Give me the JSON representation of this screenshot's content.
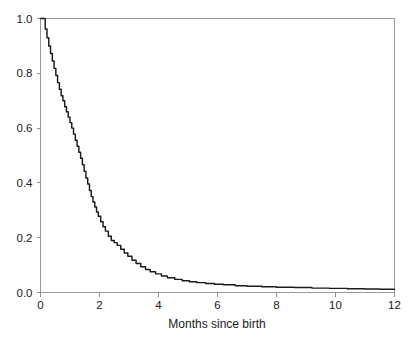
{
  "chart_data": {
    "type": "line",
    "title": "",
    "subtitle": "",
    "xlabel": "Months since birth",
    "ylabel": "",
    "xlim": [
      0,
      12
    ],
    "ylim": [
      0,
      1.0
    ],
    "grid": false,
    "legend": null,
    "x_ticks": [
      0,
      2,
      4,
      6,
      8,
      10,
      12
    ],
    "x_tick_labels": [
      "0",
      "2",
      "4",
      "6",
      "8",
      "10",
      "12"
    ],
    "y_ticks": [
      0.0,
      0.2,
      0.4,
      0.6,
      0.8,
      1.0
    ],
    "y_tick_labels": [
      "0.0",
      "0.2",
      "0.4",
      "0.6",
      "0.8",
      "1.0"
    ],
    "series": [
      {
        "name": "survival",
        "color": "#1a1a1a",
        "style": "step-decreasing",
        "x": [
          0.0,
          0.1,
          0.16,
          0.22,
          0.28,
          0.34,
          0.4,
          0.46,
          0.52,
          0.58,
          0.64,
          0.7,
          0.76,
          0.82,
          0.88,
          0.94,
          1.0,
          1.06,
          1.12,
          1.18,
          1.24,
          1.3,
          1.36,
          1.42,
          1.48,
          1.54,
          1.6,
          1.66,
          1.72,
          1.78,
          1.84,
          1.9,
          1.96,
          2.04,
          2.12,
          2.2,
          2.3,
          2.4,
          2.5,
          2.6,
          2.72,
          2.84,
          2.96,
          3.1,
          3.24,
          3.4,
          3.56,
          3.72,
          3.9,
          4.1,
          4.3,
          4.55,
          4.8,
          5.05,
          5.3,
          5.6,
          5.9,
          6.2,
          6.6,
          7.0,
          7.5,
          8.0,
          8.6,
          9.2,
          9.8,
          10.4,
          11.0,
          11.5,
          12.0
        ],
        "y": [
          1.0,
          1.0,
          0.962,
          0.93,
          0.9,
          0.872,
          0.845,
          0.818,
          0.792,
          0.766,
          0.742,
          0.718,
          0.7,
          0.678,
          0.66,
          0.64,
          0.62,
          0.6,
          0.578,
          0.556,
          0.534,
          0.512,
          0.49,
          0.466,
          0.442,
          0.418,
          0.396,
          0.372,
          0.35,
          0.33,
          0.312,
          0.294,
          0.278,
          0.258,
          0.24,
          0.224,
          0.205,
          0.19,
          0.182,
          0.172,
          0.158,
          0.144,
          0.132,
          0.118,
          0.106,
          0.094,
          0.084,
          0.076,
          0.068,
          0.06,
          0.054,
          0.048,
          0.043,
          0.039,
          0.036,
          0.033,
          0.03,
          0.028,
          0.025,
          0.023,
          0.021,
          0.019,
          0.018,
          0.016,
          0.015,
          0.014,
          0.013,
          0.012,
          0.012
        ]
      }
    ],
    "annotations": []
  },
  "figure": {
    "background_color": "#ffffff",
    "frame_color": "#9a9a9a",
    "curve_color": "#1a1a1a"
  }
}
